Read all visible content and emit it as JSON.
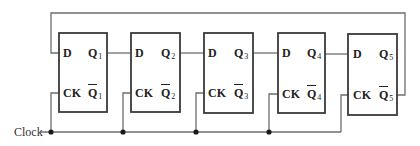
{
  "diagram": {
    "type": "Johnson counter (5-stage D flip-flop ring)",
    "clock_label": "Clock",
    "flipflops": [
      {
        "d_label": "D",
        "ck_label": "CK",
        "q_label": "Q",
        "q_sub": "1",
        "qbar_label": "Q",
        "qbar_sub": "1"
      },
      {
        "d_label": "D",
        "ck_label": "CK",
        "q_label": "Q",
        "q_sub": "2",
        "qbar_label": "Q",
        "qbar_sub": "2"
      },
      {
        "d_label": "D",
        "ck_label": "CK",
        "q_label": "Q",
        "q_sub": "3",
        "qbar_label": "Q",
        "qbar_sub": "3"
      },
      {
        "d_label": "D",
        "ck_label": "CK",
        "q_label": "Q",
        "q_sub": "4",
        "qbar_label": "Q",
        "qbar_sub": "4"
      },
      {
        "d_label": "D",
        "ck_label": "CK",
        "q_label": "Q",
        "q_sub": "5",
        "qbar_label": "Q",
        "qbar_sub": "5"
      }
    ],
    "connections": [
      "Q1 -> D2",
      "Q2 -> D3",
      "Q3 -> D4",
      "Q4 -> D5",
      "Q5-bar -> D1 (feedback)",
      "Clock -> CK1, CK2, CK3, CK4, CK5"
    ]
  }
}
